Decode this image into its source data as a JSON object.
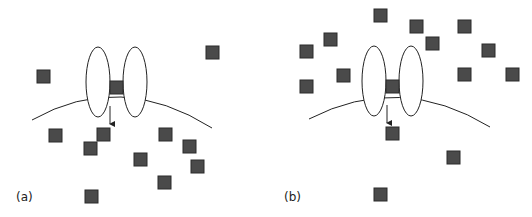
{
  "figure": {
    "colors": {
      "particle_fill": "#4a4a4a",
      "particle_stroke": "#2a2a2a",
      "line": "#222222",
      "background": "#ffffff"
    },
    "panels": [
      {
        "label": "(a)",
        "membrane": "M32,120 Q120,70 212,128",
        "channel": {
          "left": {
            "cx": 98,
            "cy": 82,
            "rx": 12,
            "ry": 35
          },
          "right": {
            "cx": 135,
            "cy": 82,
            "rx": 12,
            "ry": 35
          },
          "gate_square": [
            110,
            81
          ]
        },
        "arrow": {
          "x": 110,
          "y1": 106,
          "y2": 127
        },
        "particles": [
          [
            37,
            70
          ],
          [
            206,
            46
          ],
          [
            49,
            129
          ],
          [
            97,
            128
          ],
          [
            84,
            142
          ],
          [
            159,
            128
          ],
          [
            183,
            140
          ],
          [
            134,
            153
          ],
          [
            191,
            160
          ],
          [
            158,
            176
          ],
          [
            85,
            190
          ]
        ]
      },
      {
        "label": "(b)",
        "membrane": "M309,119 Q400,72 490,127",
        "channel": {
          "left": {
            "cx": 374,
            "cy": 81,
            "rx": 12,
            "ry": 35
          },
          "right": {
            "cx": 411,
            "cy": 81,
            "rx": 12,
            "ry": 35
          },
          "gate_square": [
            386,
            80
          ]
        },
        "arrow": {
          "x": 387,
          "y1": 105,
          "y2": 126
        },
        "particles": [
          [
            374,
            9
          ],
          [
            410,
            20
          ],
          [
            458,
            20
          ],
          [
            324,
            33
          ],
          [
            300,
            45
          ],
          [
            426,
            37
          ],
          [
            482,
            44
          ],
          [
            337,
            69
          ],
          [
            458,
            68
          ],
          [
            506,
            68
          ],
          [
            300,
            80
          ],
          [
            386,
            127
          ],
          [
            447,
            151
          ],
          [
            374,
            188
          ]
        ]
      }
    ]
  }
}
